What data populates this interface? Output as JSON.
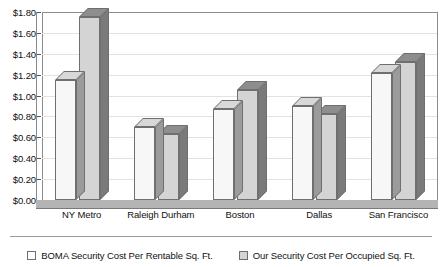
{
  "chart_data": {
    "type": "bar",
    "title": "",
    "subtitle": "",
    "xlabel": "",
    "ylabel": "",
    "ylim": [
      0,
      1.8
    ],
    "ytick_step": 0.2,
    "ytick_labels": [
      "$0.00",
      "$0.20",
      "$0.40",
      "$0.60",
      "$0.80",
      "$1.00",
      "$1.20",
      "$1.40",
      "$1.60",
      "$1.80"
    ],
    "ytick_values": [
      0,
      0.2,
      0.4,
      0.6,
      0.8,
      1.0,
      1.2,
      1.4,
      1.6,
      1.8
    ],
    "grid": true,
    "legend_position": "bottom",
    "style": "3d-clustered-column",
    "categories": [
      "NY Metro",
      "Raleigh Durham",
      "Boston",
      "Dallas",
      "San Francisco"
    ],
    "series": [
      {
        "name": "BOMA Security Cost Per Rentable Sq. Ft.",
        "color": "#f7f7f7",
        "values": [
          1.15,
          0.7,
          0.87,
          0.9,
          1.22
        ]
      },
      {
        "name": "Our Security Cost Per Occupied Sq. Ft.",
        "color": "#d4d4d4",
        "values": [
          1.75,
          0.63,
          1.05,
          0.82,
          1.32
        ]
      }
    ]
  },
  "legend": {
    "items": [
      {
        "label": "BOMA Security Cost Per Rentable Sq. Ft."
      },
      {
        "label": "Our Security Cost Per Occupied Sq. Ft."
      }
    ]
  },
  "colors": {
    "series_1_fill": "#f7f7f7",
    "series_2_fill": "#d4d4d4",
    "gridline": "#e2e2e2",
    "axis": "#8d8d8d",
    "text": "#111111"
  }
}
